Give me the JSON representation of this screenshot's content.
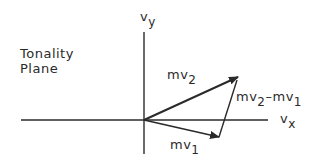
{
  "title": {
    "line1": "Tonality",
    "line2": "Plane"
  },
  "axes": {
    "y": {
      "base": "v",
      "sub": "y"
    },
    "x": {
      "base": "v",
      "sub": "x"
    }
  },
  "vectors": {
    "mv2": {
      "base": "mv",
      "sub": "2"
    },
    "mv1": {
      "base": "mv",
      "sub": "1"
    },
    "diff": {
      "base1": "mv",
      "sub1": "2",
      "minus": "–",
      "base2": "mv",
      "sub2": "1"
    }
  },
  "colors": {
    "stroke": "#2a2a2a",
    "background": "#ffffff"
  }
}
